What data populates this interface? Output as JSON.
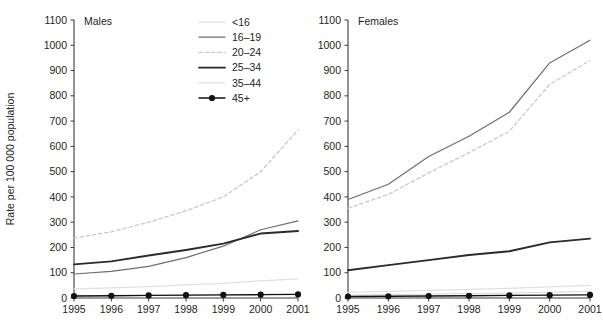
{
  "figure": {
    "y_axis_title": "Rate per 100 000 population",
    "y_ticks": [
      0,
      100,
      200,
      300,
      400,
      500,
      600,
      700,
      800,
      900,
      1000,
      1100
    ],
    "x_ticks": [
      1995,
      1996,
      1997,
      1998,
      1999,
      2000,
      2001
    ],
    "ylim": [
      0,
      1100
    ],
    "xlim": [
      1995,
      2001
    ]
  },
  "legend": {
    "position": "top-center-left-panel",
    "items": [
      {
        "label": "<16",
        "style": "solid",
        "color": "#d8d8d8",
        "width": 1.1,
        "marker": "none"
      },
      {
        "label": "16–19",
        "style": "solid",
        "color": "#6f6f6f",
        "width": 1.2,
        "marker": "none"
      },
      {
        "label": "20–24",
        "style": "dashed",
        "color": "#c9c9c9",
        "width": 1.3,
        "marker": "none"
      },
      {
        "label": "25–34",
        "style": "solid",
        "color": "#2b2b2b",
        "width": 1.9,
        "marker": "none"
      },
      {
        "label": "35–44",
        "style": "solid",
        "color": "#e0e0e0",
        "width": 1.2,
        "marker": "none"
      },
      {
        "label": "45+",
        "style": "solid",
        "color": "#111111",
        "width": 1.3,
        "marker": "dot"
      }
    ]
  },
  "chart_data": [
    {
      "type": "line",
      "title": "Males",
      "xlabel": "",
      "ylabel": "Rate per 100 000 population",
      "x": [
        1995,
        1996,
        1997,
        1998,
        1999,
        2000,
        2001
      ],
      "xlim": [
        1995,
        2001
      ],
      "ylim": [
        0,
        1100
      ],
      "grid": false,
      "series": [
        {
          "name": "<16",
          "values": [
            8,
            9,
            10,
            11,
            12,
            14,
            15
          ]
        },
        {
          "name": "16–19",
          "values": [
            95,
            105,
            125,
            160,
            205,
            270,
            305
          ]
        },
        {
          "name": "20–24",
          "values": [
            237,
            262,
            300,
            345,
            400,
            500,
            665
          ]
        },
        {
          "name": "25–34",
          "values": [
            133,
            145,
            168,
            190,
            215,
            255,
            265
          ]
        },
        {
          "name": "35–44",
          "values": [
            36,
            40,
            45,
            52,
            58,
            68,
            76
          ]
        },
        {
          "name": "45+",
          "values": [
            8,
            9,
            10,
            11,
            12,
            13,
            14
          ]
        }
      ]
    },
    {
      "type": "line",
      "title": "Females",
      "xlabel": "",
      "ylabel": "",
      "x": [
        1995,
        1996,
        1997,
        1998,
        1999,
        2000,
        2001
      ],
      "xlim": [
        1995,
        2001
      ],
      "ylim": [
        0,
        1100
      ],
      "grid": false,
      "series": [
        {
          "name": "<16",
          "values": [
            12,
            14,
            16,
            18,
            20,
            23,
            26
          ]
        },
        {
          "name": "16–19",
          "values": [
            390,
            450,
            560,
            640,
            735,
            930,
            1020
          ]
        },
        {
          "name": "20–24",
          "values": [
            355,
            410,
            495,
            575,
            660,
            845,
            940
          ]
        },
        {
          "name": "25–34",
          "values": [
            110,
            130,
            150,
            170,
            185,
            220,
            235
          ]
        },
        {
          "name": "35–44",
          "values": [
            22,
            26,
            30,
            34,
            38,
            44,
            50
          ]
        },
        {
          "name": "45+",
          "values": [
            6,
            7,
            8,
            9,
            10,
            11,
            12
          ]
        }
      ]
    }
  ]
}
